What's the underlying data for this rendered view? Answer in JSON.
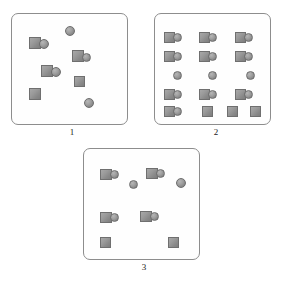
{
  "figure": {
    "title_fragment": "",
    "background_color": "#ffffff",
    "panel_border_color": "#8d8d8d",
    "shape_fill_color": "#9a9a9a",
    "shape_edge_color": "#6f6f6f"
  },
  "panels": [
    {
      "label": "1",
      "name": "panel-1",
      "arrangement": "scattered",
      "counts": {
        "pairs": 3,
        "lone_squares": 2,
        "lone_circles": 2,
        "total_squares": 5,
        "total_circles": 5
      },
      "box": {
        "x": 11,
        "y": 13,
        "w": 117,
        "h": 112
      },
      "label_pos": {
        "x": 62,
        "y": 127
      },
      "shapes": [
        {
          "type": "circle",
          "name": "circle",
          "x": 65,
          "y": 26,
          "w": 10,
          "h": 10
        },
        {
          "type": "square",
          "name": "square",
          "x": 29,
          "y": 37,
          "w": 12,
          "h": 12
        },
        {
          "type": "circle",
          "name": "circle",
          "x": 39,
          "y": 39,
          "w": 10,
          "h": 10
        },
        {
          "type": "square",
          "name": "square",
          "x": 72,
          "y": 50,
          "w": 12,
          "h": 12
        },
        {
          "type": "circle",
          "name": "circle",
          "x": 82,
          "y": 53,
          "w": 9,
          "h": 9
        },
        {
          "type": "square",
          "name": "square",
          "x": 41,
          "y": 65,
          "w": 12,
          "h": 12
        },
        {
          "type": "circle",
          "name": "circle",
          "x": 51,
          "y": 67,
          "w": 10,
          "h": 10
        },
        {
          "type": "square",
          "name": "square",
          "x": 74,
          "y": 76,
          "w": 11,
          "h": 11
        },
        {
          "type": "square",
          "name": "square",
          "x": 29,
          "y": 88,
          "w": 12,
          "h": 12
        },
        {
          "type": "circle",
          "name": "circle",
          "x": 84,
          "y": 98,
          "w": 10,
          "h": 10
        }
      ]
    },
    {
      "label": "2",
      "name": "panel-2",
      "arrangement": "regular-grid",
      "counts": {
        "pairs": 10,
        "lone_squares": 3,
        "lone_circles": 3,
        "total_squares": 13,
        "total_circles": 13
      },
      "box": {
        "x": 154,
        "y": 13,
        "w": 117,
        "h": 112
      },
      "label_pos": {
        "x": 206,
        "y": 127
      },
      "shapes": [
        {
          "type": "square",
          "name": "square",
          "x": 164,
          "y": 32,
          "w": 11,
          "h": 11
        },
        {
          "type": "circle",
          "name": "circle",
          "x": 173,
          "y": 33,
          "w": 9,
          "h": 9
        },
        {
          "type": "square",
          "name": "square",
          "x": 199,
          "y": 32,
          "w": 11,
          "h": 11
        },
        {
          "type": "circle",
          "name": "circle",
          "x": 208,
          "y": 33,
          "w": 9,
          "h": 9
        },
        {
          "type": "square",
          "name": "square",
          "x": 235,
          "y": 32,
          "w": 11,
          "h": 11
        },
        {
          "type": "circle",
          "name": "circle",
          "x": 244,
          "y": 33,
          "w": 9,
          "h": 9
        },
        {
          "type": "square",
          "name": "square",
          "x": 164,
          "y": 51,
          "w": 11,
          "h": 11
        },
        {
          "type": "circle",
          "name": "circle",
          "x": 173,
          "y": 52,
          "w": 9,
          "h": 9
        },
        {
          "type": "square",
          "name": "square",
          "x": 199,
          "y": 51,
          "w": 11,
          "h": 11
        },
        {
          "type": "circle",
          "name": "circle",
          "x": 208,
          "y": 52,
          "w": 9,
          "h": 9
        },
        {
          "type": "square",
          "name": "square",
          "x": 235,
          "y": 51,
          "w": 11,
          "h": 11
        },
        {
          "type": "circle",
          "name": "circle",
          "x": 244,
          "y": 52,
          "w": 9,
          "h": 9
        },
        {
          "type": "circle",
          "name": "circle",
          "x": 173,
          "y": 71,
          "w": 9,
          "h": 9
        },
        {
          "type": "circle",
          "name": "circle",
          "x": 208,
          "y": 71,
          "w": 9,
          "h": 9
        },
        {
          "type": "circle",
          "name": "circle",
          "x": 246,
          "y": 71,
          "w": 9,
          "h": 9
        },
        {
          "type": "square",
          "name": "square",
          "x": 164,
          "y": 89,
          "w": 11,
          "h": 11
        },
        {
          "type": "circle",
          "name": "circle",
          "x": 173,
          "y": 90,
          "w": 9,
          "h": 9
        },
        {
          "type": "square",
          "name": "square",
          "x": 199,
          "y": 89,
          "w": 11,
          "h": 11
        },
        {
          "type": "circle",
          "name": "circle",
          "x": 208,
          "y": 90,
          "w": 9,
          "h": 9
        },
        {
          "type": "square",
          "name": "square",
          "x": 235,
          "y": 89,
          "w": 11,
          "h": 11
        },
        {
          "type": "circle",
          "name": "circle",
          "x": 244,
          "y": 90,
          "w": 9,
          "h": 9
        },
        {
          "type": "square",
          "name": "square",
          "x": 164,
          "y": 106,
          "w": 11,
          "h": 11
        },
        {
          "type": "circle",
          "name": "circle",
          "x": 173,
          "y": 107,
          "w": 9,
          "h": 9
        },
        {
          "type": "square",
          "name": "square",
          "x": 202,
          "y": 106,
          "w": 11,
          "h": 11
        },
        {
          "type": "square",
          "name": "square",
          "x": 227,
          "y": 106,
          "w": 11,
          "h": 11
        },
        {
          "type": "square",
          "name": "square",
          "x": 250,
          "y": 106,
          "w": 11,
          "h": 11
        }
      ]
    },
    {
      "label": "3",
      "name": "panel-3",
      "arrangement": "sparse",
      "counts": {
        "pairs": 4,
        "lone_squares": 2,
        "lone_circles": 2,
        "total_squares": 6,
        "total_circles": 6
      },
      "box": {
        "x": 83,
        "y": 148,
        "w": 117,
        "h": 112
      },
      "label_pos": {
        "x": 134,
        "y": 262
      },
      "shapes": [
        {
          "type": "square",
          "name": "square",
          "x": 100,
          "y": 169,
          "w": 12,
          "h": 11
        },
        {
          "type": "circle",
          "name": "circle",
          "x": 110,
          "y": 170,
          "w": 9,
          "h": 9
        },
        {
          "type": "square",
          "name": "square",
          "x": 146,
          "y": 168,
          "w": 12,
          "h": 11
        },
        {
          "type": "circle",
          "name": "circle",
          "x": 156,
          "y": 169,
          "w": 9,
          "h": 9
        },
        {
          "type": "circle",
          "name": "circle",
          "x": 129,
          "y": 180,
          "w": 9,
          "h": 9
        },
        {
          "type": "circle",
          "name": "circle",
          "x": 176,
          "y": 178,
          "w": 10,
          "h": 10
        },
        {
          "type": "square",
          "name": "square",
          "x": 100,
          "y": 212,
          "w": 12,
          "h": 11
        },
        {
          "type": "circle",
          "name": "circle",
          "x": 110,
          "y": 213,
          "w": 9,
          "h": 9
        },
        {
          "type": "square",
          "name": "square",
          "x": 140,
          "y": 211,
          "w": 12,
          "h": 11
        },
        {
          "type": "circle",
          "name": "circle",
          "x": 150,
          "y": 212,
          "w": 9,
          "h": 9
        },
        {
          "type": "square",
          "name": "square",
          "x": 100,
          "y": 237,
          "w": 11,
          "h": 11
        },
        {
          "type": "square",
          "name": "square",
          "x": 168,
          "y": 237,
          "w": 11,
          "h": 11
        }
      ]
    }
  ]
}
